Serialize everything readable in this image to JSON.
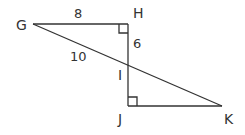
{
  "diagram": {
    "type": "geometry-triangles",
    "stroke_color": "#333333",
    "background": "#ffffff",
    "points": {
      "G": {
        "label": "G",
        "x": 33,
        "y": 24
      },
      "H": {
        "label": "H",
        "x": 128,
        "y": 24
      },
      "I": {
        "label": "I",
        "x": 128,
        "y": 63
      },
      "J": {
        "label": "J",
        "x": 128,
        "y": 106
      },
      "K": {
        "label": "K",
        "x": 222,
        "y": 106
      }
    },
    "segments": [
      {
        "from": "G",
        "to": "H",
        "length_label": "8"
      },
      {
        "from": "H",
        "to": "I",
        "length_label": "6"
      },
      {
        "from": "G",
        "to": "I",
        "length_label": "10"
      },
      {
        "from": "I",
        "to": "J",
        "length_label": ""
      },
      {
        "from": "J",
        "to": "K",
        "length_label": ""
      },
      {
        "from": "I",
        "to": "K",
        "length_label": ""
      }
    ],
    "right_angles": [
      "H",
      "J"
    ],
    "labels": {
      "G": "G",
      "H": "H",
      "I": "I",
      "J": "J",
      "K": "K",
      "GH": "8",
      "HI": "6",
      "GI": "10"
    }
  }
}
